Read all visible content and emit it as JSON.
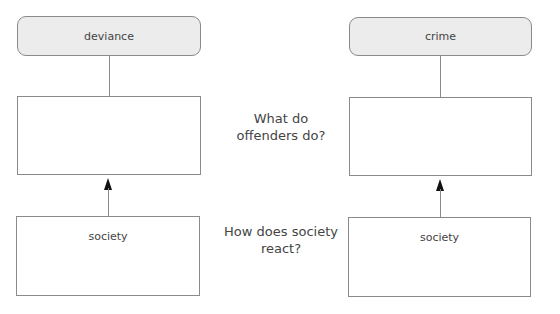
{
  "diagram": {
    "left": {
      "header": "deviance",
      "middle_box": "",
      "bottom_box": "society"
    },
    "right": {
      "header": "crime",
      "middle_box": "",
      "bottom_box": "society"
    },
    "questions": {
      "top": "What do offenders do?",
      "bottom": "How does society react?"
    },
    "colors": {
      "header_fill": "#ececec",
      "border": "#8a8a8a",
      "arrow": "#111111"
    }
  }
}
